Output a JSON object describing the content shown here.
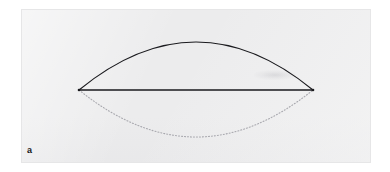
{
  "figure": {
    "panel_label": "a",
    "background_color": "#ffffff",
    "panel_color": "#ececed",
    "stroke_color": "#1a1a1e",
    "dotted_stroke_color": "#a8a8ae"
  },
  "chart_data": {
    "type": "line",
    "title": "",
    "subtitle": "",
    "xlabel": "",
    "ylabel": "",
    "xlim": [
      0,
      390
    ],
    "ylim": [
      0,
      172
    ],
    "grid": false,
    "legend": null,
    "annotations": [
      {
        "name": "panel-label",
        "text": "a",
        "x": 29,
        "y": 151
      }
    ],
    "series": [
      {
        "name": "upper-arc",
        "style": "solid",
        "color": "#1a1a1e",
        "width": 1.1,
        "description": "solid upper circular arc of the lens (vesica) shape",
        "endpoints": [
          [
            79,
            90
          ],
          [
            313,
            90
          ]
        ],
        "apex": [
          196,
          42
        ],
        "sagitta": 48
      },
      {
        "name": "chord",
        "style": "solid",
        "color": "#1a1a1e",
        "width": 1.4,
        "description": "straight horizontal chord joining the two lens vertices",
        "endpoints": [
          [
            79,
            90
          ],
          [
            313,
            90
          ]
        ],
        "length": 234
      },
      {
        "name": "lower-arc",
        "style": "dotted",
        "color": "#a8a8ae",
        "width": 1.1,
        "description": "dotted lower circular arc of the lens (vesica) shape",
        "endpoints": [
          [
            79,
            90
          ],
          [
            313,
            90
          ]
        ],
        "apex": [
          196,
          137
        ],
        "sagitta": 47
      }
    ],
    "vertices": [
      {
        "name": "left-vertex",
        "x": 79,
        "y": 90
      },
      {
        "name": "right-vertex",
        "x": 313,
        "y": 90
      }
    ]
  }
}
